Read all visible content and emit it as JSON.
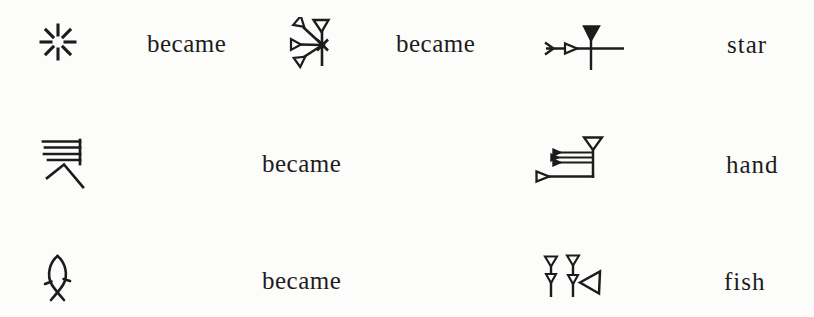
{
  "colors": {
    "background": "#fcfcfa",
    "ink": "#1c1c1c"
  },
  "rows": [
    {
      "pictograph_icon": "eight-rayed-star-burst-pictograph",
      "connector_1": "became",
      "intermediate_icon": "early-cuneiform-star-sign",
      "connector_2": "became",
      "final_icon": "cuneiform-star-sign-dingir",
      "label": "star"
    },
    {
      "pictograph_icon": "hand-pictograph",
      "connector_1": "became",
      "final_icon": "cuneiform-hand-sign",
      "label": "hand"
    },
    {
      "pictograph_icon": "fish-pictograph",
      "connector_1": "became",
      "final_icon": "cuneiform-fish-sign",
      "label": "fish"
    }
  ]
}
